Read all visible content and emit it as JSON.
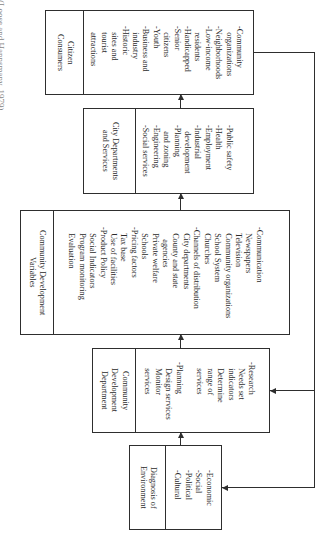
{
  "caption": "(Loose and Hannsmany, 1979)",
  "boxes": {
    "citizen": {
      "title": "Citizen\nConsumers",
      "items": "-Community\n   organizations\n-Neighborhoods\n-Low-income\n   residents\n-Handicapped\n-Senior\n   citizens\n-Youth\n-Business and\n   industry\n-Historic\n   sites and\n   tourist\n   attractions"
    },
    "city": {
      "title": "City Departments\nand Services",
      "items": "-Public safety\n-Health\n-Employment\n-Industrial\n   development\n-Planning\n   and zoning\n-Engineering\n-Social services"
    },
    "variables": {
      "title": "Community Development\nVariables",
      "items": "-Communication\n   Newspapers\n   Television\n   Community organizations\n   School System\n   Churches\n-Channels of distribution\n   City departments\n   County and state\n      agencies\n   Private welfare\n   Schools\n-Pricing factors\n   Tax base\n   Use of facilities\n-Product Policy\n   Social Indicators\n   Program monitoring\n   Evaluation"
    },
    "department": {
      "title": "Community\nDevelopment\nDepartment",
      "items": "-Research\n   Needs set\n   indicators\n   Determine\n   range of\n   services\n\n-Planning\n   Design services\n   Monitor\n   services"
    },
    "diagnosis": {
      "title": "Diagnosis of\nEnvironment",
      "items": "-Economic\n-Social\n-Political\n-Cultural"
    }
  }
}
